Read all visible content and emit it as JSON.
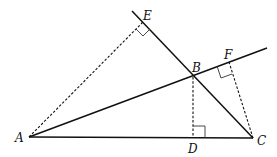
{
  "diagram": {
    "type": "geometry",
    "points": {
      "A": {
        "label": "A",
        "x": 29,
        "y": 137
      },
      "B": {
        "label": "B",
        "x": 193,
        "y": 77
      },
      "C": {
        "label": "C",
        "x": 253,
        "y": 138
      },
      "D": {
        "label": "D",
        "x": 193,
        "y": 138
      },
      "E": {
        "label": "E",
        "x": 143,
        "y": 22
      },
      "F": {
        "label": "F",
        "x": 229,
        "y": 62
      }
    },
    "segments": [
      {
        "from": "A",
        "to": "C",
        "style": "solid"
      },
      {
        "from": "A",
        "to": "B",
        "style": "solid",
        "extended": true
      },
      {
        "from": "C",
        "to": "B",
        "style": "solid",
        "extended": true
      },
      {
        "from": "A",
        "to": "E",
        "style": "dashed"
      },
      {
        "from": "B",
        "to": "D",
        "style": "dashed"
      },
      {
        "from": "C",
        "to": "F",
        "style": "dashed"
      }
    ],
    "right_angles": [
      "E",
      "D",
      "F"
    ],
    "labels": {
      "A": "A",
      "B": "B",
      "C": "C",
      "D": "D",
      "E": "E",
      "F": "F"
    }
  }
}
